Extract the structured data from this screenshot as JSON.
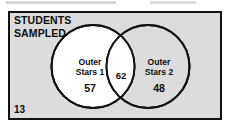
{
  "figure": {
    "type": "venn-diagram",
    "universe_label": "STUDENTS\nSAMPLED",
    "universe_outside_count": "13",
    "sets": [
      {
        "id": "left",
        "label": "Outer\nStars 1",
        "exclusive_count": "57"
      },
      {
        "id": "right",
        "label": "Outer\nStars 2",
        "exclusive_count": "48"
      }
    ],
    "intersection_count": "62",
    "colors": {
      "universe_fill": "#dcdcdc",
      "circle_fill": "#ffffff",
      "stroke": "#121212",
      "text": "#0d0d0d"
    }
  }
}
